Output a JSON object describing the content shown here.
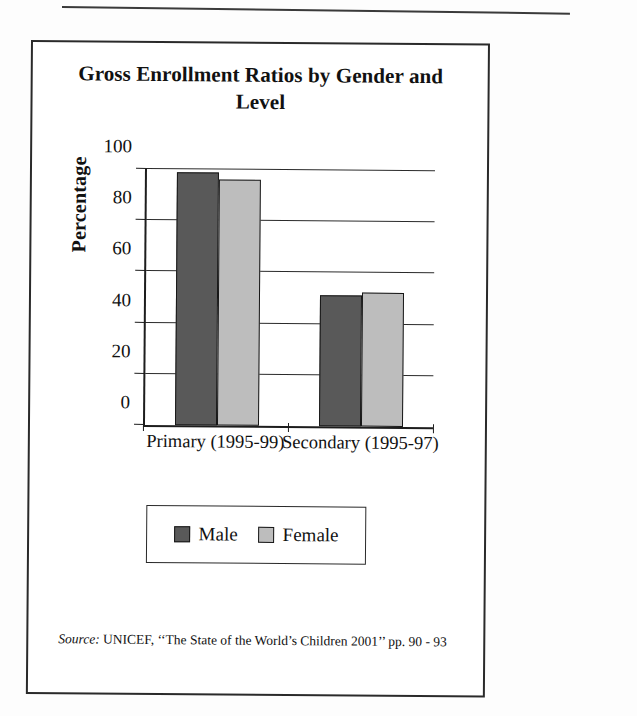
{
  "figure": {
    "title": "Gross Enrollment Ratios by Gender and Level",
    "title_line1": "Gross Enrollment Ratios by Gender and",
    "title_line2": "Level",
    "source_prefix": "Source:",
    "source_text": " UNICEF, ‘‘The State of the World’s Children 2001’’ pp. 90 - 93"
  },
  "legend": {
    "position": "bottom-center",
    "items": [
      {
        "label": "Male",
        "color": "#595959"
      },
      {
        "label": "Female",
        "color": "#bdbdbd"
      }
    ]
  },
  "colors": {
    "male": "#595959",
    "female": "#bdbdbd",
    "outline": "#171717",
    "axis": "#1d1d1d",
    "grid": "#2b2b2b",
    "paper": "#ffffff"
  },
  "chart_data": {
    "type": "bar",
    "title": "Gross Enrollment Ratios by Gender and Level",
    "xlabel": "",
    "ylabel": "Percentage",
    "categories": [
      "Primary (1995-99)",
      "Secondary (1995-97)"
    ],
    "series": [
      {
        "name": "Male",
        "values": [
          99,
          51
        ],
        "color": "#595959"
      },
      {
        "name": "Female",
        "values": [
          96,
          52.5
        ],
        "color": "#bdbdbd"
      }
    ],
    "ylim": [
      0,
      100
    ],
    "yticks": [
      0,
      20,
      40,
      60,
      80,
      100
    ],
    "ytick_labels": [
      "0",
      "20",
      "40",
      "60",
      "80",
      "100"
    ],
    "grid": true,
    "grid_axis": "y",
    "legend": true,
    "legend_position": "bottom-center",
    "bar_group_gap": true,
    "source": "Source: UNICEF, ‘‘The State of the World’s Children 2001’’ pp. 90 - 93"
  }
}
